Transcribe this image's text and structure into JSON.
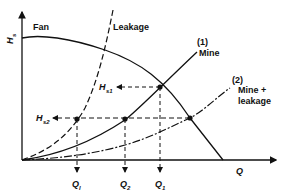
{
  "diagram": {
    "type": "fan and mine characteristic curves",
    "axes": {
      "y_label": "H",
      "y_label_sub": "s",
      "x_label": "Q"
    },
    "curves": {
      "fan": {
        "label": "Fan"
      },
      "leakage": {
        "label": "Leakage"
      },
      "mine": {
        "number": "(1)",
        "label": "Mine"
      },
      "mine_leakage": {
        "number": "(2)",
        "label_line1": "Mine +",
        "label_line2": "leakage"
      }
    },
    "pressure_labels": {
      "hs1": {
        "main": "H",
        "sub": "s1"
      },
      "hs2": {
        "main": "H",
        "sub": "s2"
      }
    },
    "flow_labels": {
      "ql": {
        "main": "Q",
        "sub": "l"
      },
      "q2": {
        "main": "Q",
        "sub": "2"
      },
      "q1": {
        "main": "Q",
        "sub": "1"
      }
    },
    "colors": {
      "line": "#111111",
      "background": "#ffffff"
    }
  }
}
